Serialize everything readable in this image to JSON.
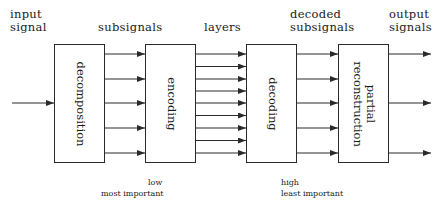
{
  "labels": {
    "input_signal": [
      "input",
      "signal"
    ],
    "subsignals": "subsignals",
    "layers": "layers",
    "decoded_subsignals": [
      "decoded",
      "subsignals"
    ],
    "output_signals": [
      "output",
      "signals"
    ]
  },
  "blocks": {
    "decomposition": "decomposition",
    "encoding": "encoding",
    "decoding": "decoding",
    "partial_reconstruction": [
      "partial",
      "reconstruction"
    ]
  },
  "annotations": {
    "low": "low",
    "most_important": "most important",
    "high": "high",
    "least_important": "least important"
  },
  "structure": {
    "input_arrows": 1,
    "subsignal_arrows": 5,
    "layer_arrows": 9,
    "decoded_arrows": 5,
    "output_arrows": 3
  },
  "colors": {
    "stroke": "#2a2a2a",
    "text": "#1a1a1a",
    "background": "#ffffff"
  }
}
